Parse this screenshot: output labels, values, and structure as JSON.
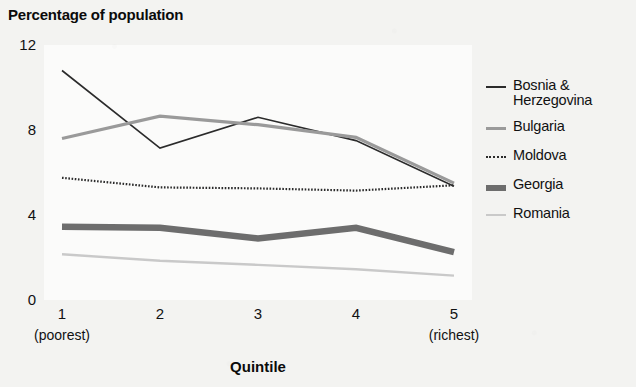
{
  "chart_data": {
    "type": "line",
    "title": "Percentage of population",
    "xlabel": "Quintile",
    "ylabel": "",
    "categories": [
      "1",
      "2",
      "3",
      "4",
      "5"
    ],
    "category_sublabels": [
      "(poorest)",
      "",
      "",
      "",
      "(richest)"
    ],
    "xtick_labels": [
      "1",
      "2",
      "3",
      "4",
      "5"
    ],
    "ytick_labels": [
      "12",
      "8",
      "4",
      "0"
    ],
    "ylim": [
      0,
      12
    ],
    "ytick_values": [
      12,
      8,
      4,
      0
    ],
    "grid": false,
    "legend_position": "right",
    "series": [
      {
        "name": "Bosnia & Herzegovina",
        "values": [
          10.8,
          7.15,
          8.6,
          7.5,
          5.35
        ],
        "color": "#2b2b2b",
        "width": 1.6,
        "dash": "none"
      },
      {
        "name": "Bulgaria",
        "values": [
          7.6,
          8.65,
          8.25,
          7.65,
          5.5
        ],
        "color": "#9a9a9a",
        "width": 3.2,
        "dash": "none"
      },
      {
        "name": "Moldova",
        "values": [
          5.75,
          5.3,
          5.25,
          5.15,
          5.4
        ],
        "color": "#2b2b2b",
        "width": 2.2,
        "dash": "dotted"
      },
      {
        "name": "Georgia",
        "values": [
          3.45,
          3.4,
          2.9,
          3.4,
          2.25
        ],
        "color": "#6d6d6d",
        "width": 6.5,
        "dash": "none"
      },
      {
        "name": "Romania",
        "values": [
          2.15,
          1.85,
          1.65,
          1.45,
          1.15
        ],
        "color": "#c9c9c9",
        "width": 2.4,
        "dash": "none"
      }
    ]
  }
}
